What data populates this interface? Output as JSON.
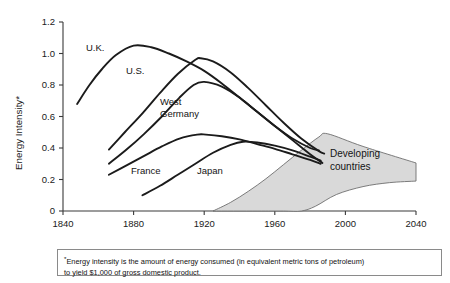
{
  "chart_data": {
    "type": "line",
    "title": "",
    "xlabel": "",
    "ylabel": "Energy Intensity*",
    "xlim": [
      1840,
      2040
    ],
    "ylim": [
      0,
      1.2
    ],
    "x_ticks": [
      1840,
      1880,
      1920,
      1960,
      2000,
      2040
    ],
    "y_ticks": [
      "0",
      "0.2",
      "0.4",
      "0.6",
      "0.8",
      "1.0",
      "1.2"
    ],
    "grid": false,
    "legend_position": "inline-annotations",
    "series": [
      {
        "name": "U.K.",
        "x": [
          1848,
          1855,
          1862,
          1870,
          1880,
          1890,
          1900,
          1910,
          1920,
          1930,
          1940,
          1950,
          1960,
          1970,
          1980,
          1985
        ],
        "values": [
          0.68,
          0.8,
          0.9,
          0.99,
          1.05,
          1.04,
          1.0,
          0.95,
          0.89,
          0.81,
          0.72,
          0.63,
          0.54,
          0.46,
          0.4,
          0.385
        ]
      },
      {
        "name": "U.S.",
        "x": [
          1866,
          1875,
          1885,
          1895,
          1905,
          1915,
          1918,
          1925,
          1935,
          1945,
          1955,
          1965,
          1975,
          1985,
          1988
        ],
        "values": [
          0.39,
          0.5,
          0.62,
          0.75,
          0.87,
          0.96,
          0.97,
          0.95,
          0.88,
          0.78,
          0.67,
          0.56,
          0.46,
          0.38,
          0.365
        ]
      },
      {
        "name": "West Germany",
        "x": [
          1866,
          1876,
          1886,
          1896,
          1906,
          1914,
          1920,
          1930,
          1940,
          1950,
          1960,
          1970,
          1980,
          1987
        ],
        "values": [
          0.3,
          0.39,
          0.49,
          0.6,
          0.72,
          0.8,
          0.82,
          0.79,
          0.72,
          0.63,
          0.54,
          0.45,
          0.36,
          0.305
        ]
      },
      {
        "name": "France",
        "x": [
          1866,
          1876,
          1886,
          1896,
          1906,
          1916,
          1921,
          1930,
          1940,
          1950,
          1960,
          1970,
          1980,
          1986
        ],
        "values": [
          0.23,
          0.29,
          0.35,
          0.41,
          0.46,
          0.485,
          0.485,
          0.475,
          0.455,
          0.425,
          0.395,
          0.36,
          0.325,
          0.3
        ]
      },
      {
        "name": "Japan",
        "x": [
          1885,
          1895,
          1905,
          1915,
          1925,
          1935,
          1942,
          1950,
          1960,
          1970,
          1980,
          1986
        ],
        "values": [
          0.1,
          0.16,
          0.23,
          0.3,
          0.37,
          0.42,
          0.44,
          0.435,
          0.415,
          0.385,
          0.345,
          0.32
        ]
      }
    ],
    "band": {
      "name": "Developing countries",
      "label_line1": "Developing",
      "label_line2": "countries",
      "upper": {
        "x": [
          1925,
          1935,
          1945,
          1955,
          1965,
          1975,
          1985,
          1990,
          2010,
          2040
        ],
        "values": [
          0.0,
          0.055,
          0.125,
          0.205,
          0.295,
          0.385,
          0.47,
          0.49,
          0.41,
          0.305
        ]
      },
      "lower": {
        "x": [
          1925,
          1950,
          1965,
          1975,
          1983,
          1995,
          2010,
          2025,
          2040
        ],
        "values": [
          0.0,
          0.0,
          0.0,
          0.0,
          0.03,
          0.105,
          0.155,
          0.18,
          0.19
        ]
      }
    }
  },
  "footnote": {
    "marker": "*",
    "line1": "Energy intensity is the amount of energy consumed (in equivalent metric tons of petroleum)",
    "line2": "to yield $1,000 of gross domestic product."
  },
  "colors": {
    "curve": "#1b1b1b",
    "band_fill": "#d9d9d9",
    "band_stroke": "#6e6e6e",
    "axis": "#3a3a3a",
    "text": "#111111",
    "background": "#ffffff"
  }
}
